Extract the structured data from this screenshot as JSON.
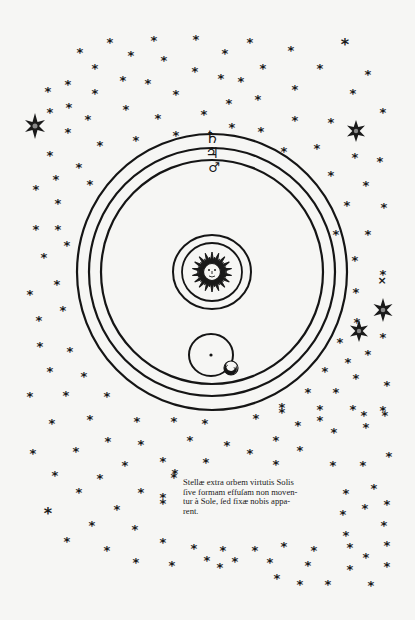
{
  "figure": {
    "colors": {
      "paper": "#f6f6f4",
      "ink": "#151515"
    },
    "caption": {
      "lines": [
        "Stellæ extra orbem virtutis Solis",
        "ſive formam effuſam non moven-",
        "tur à Sole, ſed fixæ nobis appa-",
        "rent."
      ]
    },
    "planet_symbols": {
      "saturn": "♄",
      "jupiter": "♃",
      "mars": "♂"
    },
    "center": {
      "sun": "sun-face",
      "earth": "earth-dot",
      "moon": "crescent-moon"
    },
    "orbits": [
      {
        "name": "saturn-orbit",
        "cx": 212,
        "cy": 272,
        "rx": 135,
        "ry": 138
      },
      {
        "name": "jupiter-orbit",
        "cx": 212,
        "cy": 272,
        "rx": 123,
        "ry": 124
      },
      {
        "name": "mars-orbit",
        "cx": 212,
        "cy": 272,
        "rx": 111,
        "ry": 112
      },
      {
        "name": "sun-outer-ring",
        "cx": 212,
        "cy": 272,
        "rx": 39,
        "ry": 37
      },
      {
        "name": "sun-inner-ring",
        "cx": 212,
        "cy": 272,
        "rx": 30,
        "ry": 29
      },
      {
        "name": "earth-moon-orbit",
        "cx": 211,
        "cy": 355,
        "rx": 22,
        "ry": 21
      }
    ]
  }
}
